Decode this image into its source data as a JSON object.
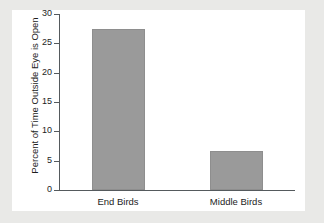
{
  "chart_data": {
    "type": "bar",
    "title": "",
    "subtitle": "",
    "xlabel": "",
    "ylabel": "Percent of Time Outside Eye is Open",
    "categories": [
      "End Birds",
      "Middle Birds"
    ],
    "values": [
      27.5,
      6.6
    ],
    "ylim": [
      0,
      30
    ],
    "yticks": [
      0,
      5,
      10,
      15,
      20,
      25,
      30
    ],
    "ytick_labels": [
      "0",
      "5",
      "10",
      "15",
      "20",
      "25",
      "30"
    ],
    "grid": false,
    "legend": null,
    "legend_position": "none",
    "bar_color": "#9a9a9a",
    "axis_color": "#555a5d",
    "panel_color": "#ffffff",
    "page_background": "#e9e9e7",
    "text_color": "#1d1d1d",
    "tick_direction": "out"
  }
}
